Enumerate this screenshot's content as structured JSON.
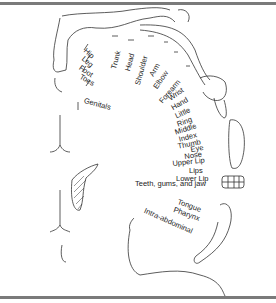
{
  "diagram": {
    "labels": {
      "hip": "Hip",
      "leg": "Leg",
      "foot": "Foot",
      "toes": "Toes",
      "genitals": "Genitals",
      "trunk": "Trunk",
      "head": "Head",
      "shoulder": "Shoulder",
      "arm": "Arm",
      "elbow": "Elbow",
      "forearm": "Forearm",
      "wrist": "Wrist",
      "hand": "Hand",
      "little": "Little",
      "ring": "Ring",
      "middle": "Middle",
      "index": "Index",
      "thumb": "Thumb",
      "eye": "Eye",
      "nose": "Nose",
      "upper_lip": "Upper Lip",
      "lips": "Lips",
      "lower_lip": "Lower Lip",
      "teeth": "Teeth, gums, and jaw",
      "tongue": "Tongue",
      "pharynx": "Pharynx",
      "intra_abdominal": "Intra-abdominal"
    },
    "colors": {
      "line": "#333333",
      "rule": "#7a7a7a"
    }
  }
}
